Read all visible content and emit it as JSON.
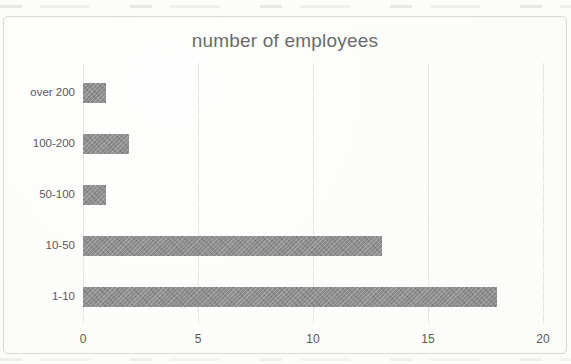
{
  "chart_data": {
    "type": "bar",
    "orientation": "horizontal",
    "title": "number of employees",
    "categories": [
      "over 200",
      "100-200",
      "50-100",
      "10-50",
      "1-10"
    ],
    "values": [
      1,
      2,
      1,
      13,
      18
    ],
    "xlabel": "",
    "ylabel": "",
    "xlim": [
      0,
      20
    ],
    "xticks": [
      0,
      5,
      10,
      15,
      20
    ],
    "grid": "vertical-only",
    "legend": "none",
    "colors": {
      "bar": "#8f8f8f",
      "title_text": "#6a6a6a",
      "axis_text": "#595959",
      "gridline": "#e4e4de",
      "frame_border": "#d8d8d3",
      "background": "#fcfcfa"
    }
  }
}
